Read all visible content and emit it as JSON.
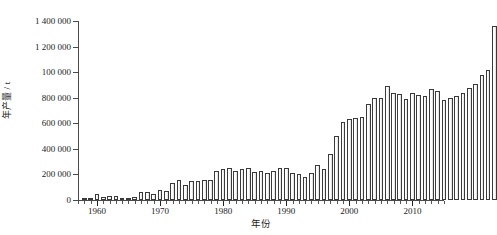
{
  "chart_data": {
    "type": "bar",
    "title": "",
    "subtitle": "",
    "xlabel": "年份",
    "ylabel": "年产量 / t",
    "xlim": [
      1957,
      2015
    ],
    "ylim": [
      0,
      1400000
    ],
    "grid": false,
    "legend": null,
    "y_ticks": [
      {
        "value": 0,
        "label": "0"
      },
      {
        "value": 200000,
        "label": "200 000"
      },
      {
        "value": 400000,
        "label": "400 000"
      },
      {
        "value": 600000,
        "label": "600 000"
      },
      {
        "value": 800000,
        "label": "800 000"
      },
      {
        "value": 1000000,
        "label": "100 000"
      },
      {
        "value": 1200000,
        "label": "1 200 000"
      },
      {
        "value": 1400000,
        "label": "1 400 000"
      }
    ],
    "x_ticks": [
      {
        "value": 1960,
        "label": "1960"
      },
      {
        "value": 1970,
        "label": "1970"
      },
      {
        "value": 1980,
        "label": "1980"
      },
      {
        "value": 1990,
        "label": "1990"
      },
      {
        "value": 2000,
        "label": "2000"
      },
      {
        "value": 2010,
        "label": "2010"
      }
    ],
    "x_minor_tick_step": 1,
    "categories": [
      1958,
      1959,
      1960,
      1961,
      1962,
      1963,
      1964,
      1965,
      1966,
      1967,
      1968,
      1969,
      1970,
      1971,
      1972,
      1973,
      1974,
      1975,
      1976,
      1977,
      1978,
      1979,
      1980,
      1981,
      1982,
      1983,
      1984,
      1985,
      1986,
      1987,
      1988,
      1989,
      1990,
      1991,
      1992,
      1993,
      1994,
      1995,
      1996,
      1997,
      1998,
      1999,
      2000,
      2001,
      2002,
      2003,
      2004,
      2005,
      2006,
      2007,
      2008,
      2009,
      2010,
      2011,
      2012,
      2013,
      2014
    ],
    "values": [
      5000,
      12000,
      45000,
      22000,
      30000,
      28000,
      18000,
      15000,
      22000,
      60000,
      65000,
      50000,
      75000,
      70000,
      135000,
      155000,
      120000,
      145000,
      150000,
      160000,
      155000,
      225000,
      240000,
      250000,
      230000,
      245000,
      250000,
      220000,
      225000,
      215000,
      230000,
      250000,
      250000,
      210000,
      200000,
      180000,
      215000,
      270000,
      245000,
      360000,
      500000,
      610000,
      630000,
      640000,
      650000,
      750000,
      795000,
      800000,
      895000,
      835000,
      830000,
      790000,
      840000,
      825000,
      810000,
      865000,
      850000
    ],
    "values_tail": [
      780000,
      800000,
      810000,
      835000,
      875000,
      910000,
      980000,
      1020000,
      1360000
    ],
    "note": "Bars are outlined black with light/white fill; single series"
  },
  "figure": {
    "background_color": "#ffffff",
    "axis_color": "#4a4a4a",
    "bar_edge_color": "#3a3a3a",
    "bar_fill_color": "#f2f2f2"
  }
}
